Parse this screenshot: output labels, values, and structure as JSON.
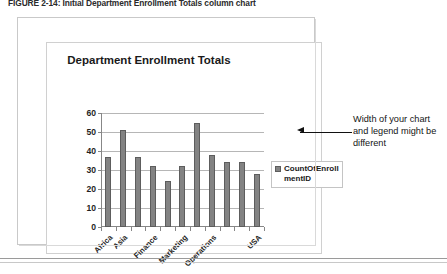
{
  "figure": {
    "caption": "FIGURE 2-14: Initial Department Enrollment Totals column chart"
  },
  "callout": {
    "text": "Width of your chart and legend might be different",
    "arrow_icon": "left-arrow-icon"
  },
  "legend": {
    "swatch_icon": "series-swatch-icon",
    "series_label": "CountOfEnrollmentID",
    "position": "right"
  },
  "chart_data": {
    "type": "bar",
    "title": "Department Enrollment Totals",
    "xlabel": "",
    "ylabel": "",
    "ylim": [
      0,
      60
    ],
    "yticks": [
      0,
      10,
      20,
      30,
      40,
      50,
      60
    ],
    "grid": true,
    "legend_position": "right",
    "categories": [
      "Africa",
      "Asia",
      "Europe",
      "Finance",
      "Human Resources",
      "Marketing",
      "Offshore",
      "Operations",
      "Sales",
      "Training",
      "USA"
    ],
    "visible_tick_labels": [
      "Africa",
      "Asia",
      "Finance",
      "Marketing",
      "Operations",
      "USA"
    ],
    "series": [
      {
        "name": "CountOfEnrollmentID",
        "color": "#838383",
        "values": [
          37,
          51,
          37,
          32,
          24,
          32,
          55,
          38,
          34,
          34,
          28
        ]
      }
    ]
  }
}
